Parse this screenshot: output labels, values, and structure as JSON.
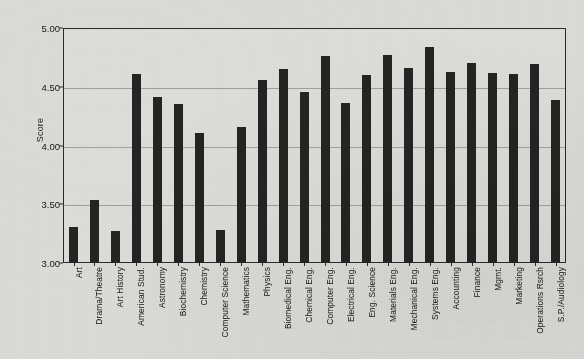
{
  "chart_data": {
    "type": "bar",
    "title": "",
    "xlabel": "",
    "ylabel": "Score",
    "ylim": [
      3.0,
      5.0
    ],
    "ytick_labels": [
      "5.00",
      "4.50",
      "4.00",
      "3.50",
      "3.00"
    ],
    "ytick_values": [
      5.0,
      4.5,
      4.0,
      3.5,
      3.0
    ],
    "grid": true,
    "legend": "none",
    "bar_color": "#242424",
    "background_color": "#dcdcd8",
    "axis_color": "#2a2a2a",
    "gridline_color": "#8d8d8a",
    "categories": [
      "Art",
      "Drama/Theatre",
      "Art History",
      "American Stud.",
      "Astronomy",
      "Biochemistry",
      "Chemistry",
      "Computer Science",
      "Mathematics",
      "Physics",
      "Biomedical Eng.",
      "Chemical Eng.",
      "Computer Eng.",
      "Electrical Eng.",
      "Eng. Science",
      "Materials Eng.",
      "Mechanical Eng.",
      "Systems Eng.",
      "Accounting",
      "Finance",
      "Mgmt.",
      "Marketing",
      "Operations Rsrch",
      "S.P./Audiology"
    ],
    "values": [
      3.31,
      3.54,
      3.27,
      4.61,
      4.41,
      4.35,
      4.11,
      3.28,
      4.16,
      4.56,
      4.65,
      4.46,
      4.76,
      4.36,
      4.6,
      4.77,
      4.66,
      4.84,
      4.63,
      4.7,
      4.62,
      4.61,
      4.69,
      4.39
    ]
  }
}
